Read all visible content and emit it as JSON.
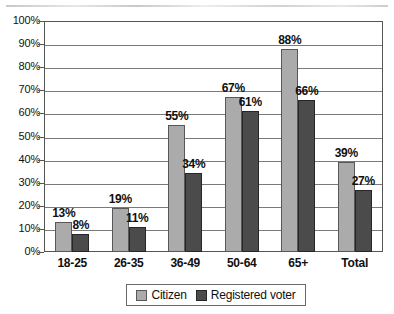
{
  "chart_data": {
    "type": "bar",
    "title": "",
    "xlabel": "",
    "ylabel": "",
    "ylim": [
      0,
      100
    ],
    "ytick_labels": [
      "100%",
      "90%",
      "80%",
      "70%",
      "60%",
      "50%",
      "40%",
      "30%",
      "20%",
      "10%",
      "0%"
    ],
    "ytick_values": [
      100,
      90,
      80,
      70,
      60,
      50,
      40,
      30,
      20,
      10,
      0
    ],
    "grid": true,
    "legend_position": "bottom",
    "categories": [
      "18-25",
      "26-35",
      "36-49",
      "50-64",
      "65+",
      "Total"
    ],
    "series": [
      {
        "name": "Citizen",
        "color": "#ababab",
        "values": [
          13,
          19,
          55,
          67,
          88,
          39
        ],
        "data_labels": [
          "13%",
          "19%",
          "55%",
          "67%",
          "88%",
          "39%"
        ]
      },
      {
        "name": "Registered voter",
        "color": "#4b4b4b",
        "values": [
          8,
          11,
          34,
          61,
          66,
          27
        ],
        "data_labels": [
          "8%",
          "11%",
          "34%",
          "61%",
          "66%",
          "27%"
        ]
      }
    ]
  },
  "legend": {
    "entries": [
      {
        "label": "Citizen",
        "swatch": "citizen-swatch"
      },
      {
        "label": "Registered voter",
        "swatch": "registered-voter-swatch"
      }
    ]
  },
  "colors": {
    "citizen": "#ababab",
    "registered_voter": "#4b4b4b",
    "gridline": "#7a7a7a",
    "axis": "#555555",
    "text": "#101010"
  }
}
